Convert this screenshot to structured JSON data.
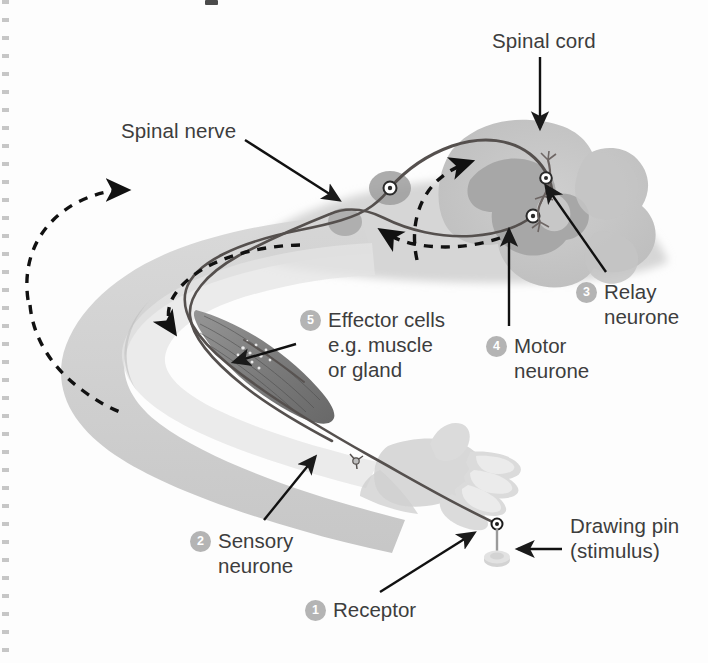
{
  "figure": {
    "background_color": "#fdfdfd",
    "skin_color": "#c9c9c9",
    "skin_light_color": "#dedede",
    "spinal_cord_outer_color": "#c7c7c7",
    "spinal_cord_grey_matter_color": "#a8a8a8",
    "nerve_line_color": "#55504e",
    "arrow_color": "#1a1a1a",
    "badge_color": "#b4b4b4",
    "text_color": "#3d3d3d"
  },
  "labels": {
    "spinal_cord": "Spinal cord",
    "spinal_nerve": "Spinal nerve",
    "drawing_pin": "Drawing pin\n(stimulus)"
  },
  "numbered_labels": [
    {
      "number": "1",
      "text": "Receptor"
    },
    {
      "number": "2",
      "text": "Sensory\nneurone"
    },
    {
      "number": "3",
      "text": "Relay\nneurone"
    },
    {
      "number": "4",
      "text": "Motor\nneurone"
    },
    {
      "number": "5",
      "text": "Effector cells\ne.g. muscle\nor gland"
    }
  ],
  "diagram_elements": {
    "arm": "human-arm-outline",
    "hand": "human-hand-outline",
    "muscle": "effector-muscle",
    "spinal_cord": "spinal-cord-cross-section",
    "sensory_neurone_path": "receptor-to-spinal-cord",
    "motor_neurone_path": "spinal-cord-to-muscle",
    "relay_neurone": "relay-neurone-in-grey-matter",
    "drawing_pin": "drawing-pin-stimulus",
    "impulse_arrows": "dashed-direction-arrows"
  }
}
